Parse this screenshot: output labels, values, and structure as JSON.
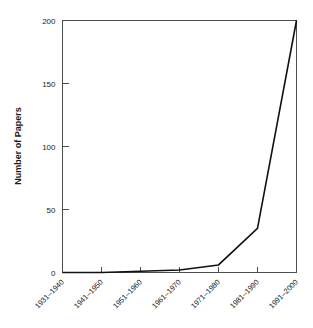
{
  "chart_data": {
    "type": "line",
    "title": "",
    "xlabel": "",
    "ylabel": "Number of Papers",
    "categories": [
      "1931–1940",
      "1941–1950",
      "1951–1960",
      "1961–1970",
      "1971–1980",
      "1981–1990",
      "1991–2000"
    ],
    "values": [
      0,
      0,
      1,
      2,
      6,
      35,
      200
    ],
    "series": [
      {
        "name": "Number of Papers",
        "values": [
          0,
          0,
          1,
          2,
          6,
          35,
          200
        ]
      }
    ],
    "ylim": [
      0,
      200
    ],
    "yticks": [
      0,
      50,
      100,
      150,
      200
    ],
    "ytick_labels": [
      "0",
      "50",
      "100",
      "150",
      "200"
    ],
    "grid": false,
    "legend": false,
    "legend_position": "none",
    "xtick_rotation": 45,
    "line_color": "#111111",
    "frame_color": "#4d4d4d",
    "background_color": "#ffffff"
  }
}
